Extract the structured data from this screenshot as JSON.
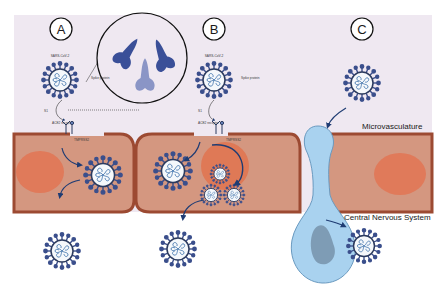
{
  "figure": {
    "panels": [
      {
        "id": "A",
        "label": "A"
      },
      {
        "id": "B",
        "label": "B"
      },
      {
        "id": "C",
        "label": "C"
      }
    ],
    "annotations": {
      "virus_name": "SARS-CoV-2",
      "spike_protein": "Spike protein",
      "s1": "S1",
      "ace2_receptor": "ACE2 receptor",
      "tmprss2": "TMPRSS2",
      "microvasculature": "Microvasculature",
      "central_nervous_system": "Central Nervous System"
    },
    "colors": {
      "background_panel": "#efe8f1",
      "cell_fill": "#d49780",
      "cell_border": "#9c4a32",
      "nucleus": "#e07a5a",
      "endosome": "#e0734f",
      "virus_ring": "#2b3a5e",
      "virus_spike": "#3b4f8c",
      "virus_rna": "#4a7ab0",
      "neuron_fill": "#a9d2ef",
      "neuron_nucleus": "#7e9cb5",
      "arrow": "#1f3c73",
      "spike_dark": "#3a4f98",
      "spike_light": "#8a95c6"
    }
  }
}
